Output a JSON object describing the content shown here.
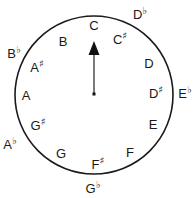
{
  "diagram": {
    "circle": {
      "cx": 94,
      "cy": 95,
      "r": 79,
      "stroke": "#1a1a1a"
    },
    "pointer": {
      "from": [
        94,
        94
      ],
      "to_label": "C",
      "color": "#1a1a1a"
    },
    "inner_notes": [
      {
        "id": "c",
        "letter": "C",
        "accidental": "",
        "x": 94,
        "y": 25
      },
      {
        "id": "cs",
        "letter": "C",
        "accidental": "♯",
        "x": 120,
        "y": 38
      },
      {
        "id": "d",
        "letter": "D",
        "accidental": "",
        "x": 149,
        "y": 63
      },
      {
        "id": "ds",
        "letter": "D",
        "accidental": "♯",
        "x": 156,
        "y": 92
      },
      {
        "id": "e",
        "letter": "E",
        "accidental": "",
        "x": 153,
        "y": 124
      },
      {
        "id": "f",
        "letter": "F",
        "accidental": "",
        "x": 130,
        "y": 152
      },
      {
        "id": "fs",
        "letter": "F",
        "accidental": "♯",
        "x": 98,
        "y": 163
      },
      {
        "id": "g",
        "letter": "G",
        "accidental": "",
        "x": 61,
        "y": 153
      },
      {
        "id": "gs",
        "letter": "G",
        "accidental": "♯",
        "x": 38,
        "y": 124
      },
      {
        "id": "a",
        "letter": "A",
        "accidental": "",
        "x": 26,
        "y": 95
      },
      {
        "id": "as",
        "letter": "A",
        "accidental": "♯",
        "x": 37,
        "y": 66
      },
      {
        "id": "b",
        "letter": "B",
        "accidental": "",
        "x": 63,
        "y": 41
      }
    ],
    "outer_notes": [
      {
        "id": "db",
        "letter": "D",
        "accidental": "♭",
        "x": 140,
        "y": 13
      },
      {
        "id": "eb",
        "letter": "E",
        "accidental": "♭",
        "x": 185,
        "y": 92
      },
      {
        "id": "gb",
        "letter": "G",
        "accidental": "♭",
        "x": 93,
        "y": 187
      },
      {
        "id": "ab",
        "letter": "A",
        "accidental": "♭",
        "x": 10,
        "y": 143
      },
      {
        "id": "bb",
        "letter": "B",
        "accidental": "♭",
        "x": 14,
        "y": 52
      }
    ]
  }
}
